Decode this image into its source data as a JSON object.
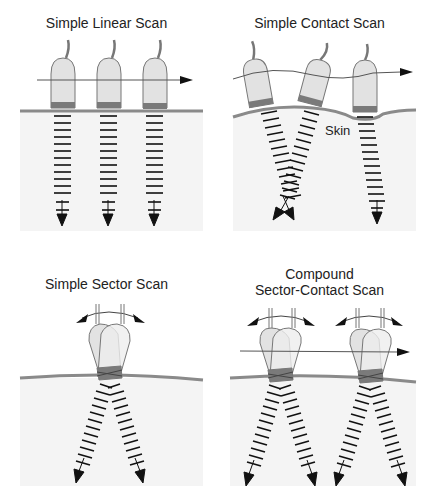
{
  "figure": {
    "panels": [
      {
        "id": "linear",
        "title": "Simple Linear Scan",
        "transducer_count": 3,
        "motion": "translate"
      },
      {
        "id": "contact",
        "title": "Simple Contact Scan",
        "label": "Skin",
        "transducer_count": 3,
        "motion": "translate-along-contour"
      },
      {
        "id": "sector",
        "title": "Simple Sector Scan",
        "transducer_count": 1,
        "motion": "rock"
      },
      {
        "id": "compound",
        "title_line1": "Compound",
        "title_line2": "Sector-Contact Scan",
        "transducer_count": 2,
        "motion": "rock-and-translate"
      }
    ],
    "colors": {
      "skin_line": "#8a8a8a",
      "tissue_fill": "#f4f4f4",
      "transducer_fill": "#e2e2e2",
      "transducer_face": "#7a7a7a",
      "pulse": "#111111",
      "arrow": "#111111"
    },
    "icons": [
      "transducer-icon",
      "beam-arrow-icon",
      "motion-arrow-icon",
      "rocking-arrow-icon"
    ]
  }
}
